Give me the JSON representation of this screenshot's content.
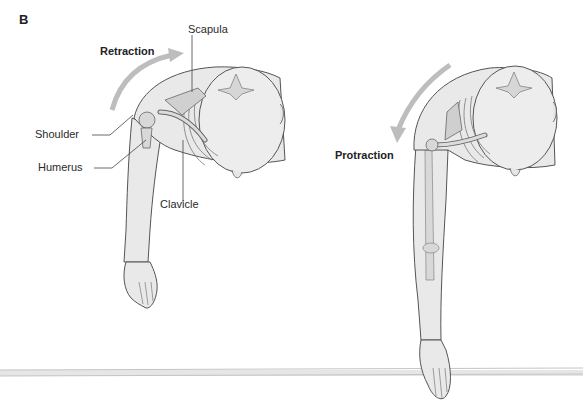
{
  "panel_letter": "B",
  "figures": [
    {
      "name": "retraction",
      "movement_label": "Retraction",
      "arrow_direction": "clockwise-up-right",
      "labels": {
        "scapula": "Scapula",
        "shoulder": "Shoulder",
        "humerus": "Humerus",
        "clavicle": "Clavicle"
      }
    },
    {
      "name": "protraction",
      "movement_label": "Protraction",
      "arrow_direction": "counterclockwise-down-left"
    }
  ],
  "colors": {
    "skin_fill": "#e9e9e9",
    "outline": "#555555",
    "bone_fill": "#d6d6d6",
    "arrow": "#bdbdbd",
    "table_edge": "#c8c8c8"
  }
}
